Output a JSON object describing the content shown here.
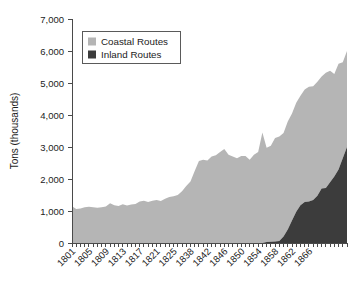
{
  "chart_data": {
    "type": "area",
    "stacked": true,
    "title": "",
    "subtitle": "",
    "xlabel": "",
    "ylabel": "Tons (thousands)",
    "ylim": [
      0,
      7000
    ],
    "xlim": [
      1801,
      1866
    ],
    "grid": false,
    "legend_position": "top-left",
    "y_ticks": [
      0,
      1000,
      2000,
      3000,
      4000,
      5000,
      6000,
      7000
    ],
    "y_tick_labels": [
      "0",
      "1,000",
      "2,000",
      "3,000",
      "4,000",
      "5,000",
      "6,000",
      "7,000"
    ],
    "x_tick_labels": [
      "1801",
      "1805",
      "1809",
      "1813",
      "1817",
      "1821",
      "1825",
      "1838",
      "1842",
      "1846",
      "1850",
      "1854",
      "1858",
      "1862",
      "1866"
    ],
    "x_tick_label_years": [
      1801,
      1805,
      1809,
      1813,
      1817,
      1821,
      1825,
      1829,
      1833,
      1837,
      1841,
      1845,
      1849,
      1853,
      1857
    ],
    "x_minor_tick_interval": 1,
    "x": [
      1801,
      1802,
      1803,
      1804,
      1805,
      1806,
      1807,
      1808,
      1809,
      1810,
      1811,
      1812,
      1813,
      1814,
      1815,
      1816,
      1817,
      1818,
      1819,
      1820,
      1821,
      1822,
      1823,
      1824,
      1825,
      1826,
      1827,
      1828,
      1829,
      1830,
      1831,
      1832,
      1833,
      1834,
      1835,
      1836,
      1837,
      1838,
      1839,
      1840,
      1841,
      1842,
      1843,
      1844,
      1845,
      1846,
      1847,
      1848,
      1849,
      1850,
      1851,
      1852,
      1853,
      1854,
      1855,
      1856,
      1857,
      1858,
      1859,
      1860,
      1861,
      1862,
      1863,
      1864,
      1865,
      1866
    ],
    "series": [
      {
        "name": "Inland Routes",
        "color": "#3c3c3c",
        "values": [
          0,
          0,
          0,
          0,
          0,
          0,
          0,
          0,
          0,
          0,
          0,
          0,
          0,
          0,
          0,
          0,
          0,
          0,
          0,
          0,
          0,
          0,
          0,
          0,
          0,
          0,
          0,
          0,
          0,
          0,
          0,
          0,
          0,
          0,
          0,
          0,
          0,
          0,
          0,
          0,
          0,
          0,
          0,
          0,
          0,
          0,
          30,
          40,
          50,
          60,
          200,
          420,
          700,
          980,
          1180,
          1280,
          1300,
          1340,
          1480,
          1700,
          1720,
          1900,
          2080,
          2300,
          2650,
          3000
        ]
      },
      {
        "name": "Coastal Routes",
        "color": "#b5b5b5",
        "values": [
          1150,
          1060,
          1080,
          1120,
          1130,
          1120,
          1100,
          1120,
          1140,
          1240,
          1180,
          1160,
          1210,
          1170,
          1200,
          1220,
          1300,
          1320,
          1280,
          1320,
          1340,
          1310,
          1380,
          1440,
          1460,
          1500,
          1620,
          1780,
          1920,
          2250,
          2560,
          2600,
          2580,
          2700,
          2740,
          2840,
          2940,
          2760,
          2700,
          2650,
          2720,
          2720,
          2600,
          2760,
          2840,
          3450,
          2950,
          3000,
          3230,
          3270,
          3240,
          3380,
          3350,
          3400,
          3420,
          3520,
          3580,
          3560,
          3560,
          3500,
          3600,
          3480,
          3200,
          3300,
          3000,
          3000
        ]
      }
    ],
    "totals": [
      1150,
      1060,
      1080,
      1120,
      1130,
      1120,
      1100,
      1120,
      1140,
      1240,
      1180,
      1160,
      1210,
      1170,
      1200,
      1220,
      1300,
      1320,
      1280,
      1320,
      1340,
      1310,
      1380,
      1440,
      1460,
      1500,
      1620,
      1780,
      1920,
      2250,
      2560,
      2600,
      2580,
      2700,
      2740,
      2840,
      2940,
      2760,
      2700,
      2650,
      2720,
      2720,
      2600,
      2760,
      2840,
      3450,
      2980,
      3040,
      3280,
      3330,
      3440,
      3800,
      4050,
      4380,
      4600,
      4800,
      4880,
      4900,
      5040,
      5200,
      5320,
      5380,
      5280,
      5600,
      5650,
      6000
    ]
  },
  "legend": {
    "entries": [
      {
        "label": "Coastal Routes",
        "color": "#b5b5b5"
      },
      {
        "label": "Inland Routes",
        "color": "#3c3c3c"
      }
    ]
  },
  "axes": {
    "y_title": "Tons (thousands)"
  }
}
